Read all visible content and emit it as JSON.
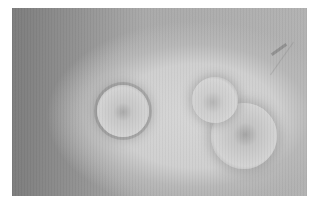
{
  "image": {
    "description": "Grayscale micrograph showing a single round cell on the left and a budding/dividing double cell on the right, set within a lighter halo on a darker grainy background",
    "objects": [
      {
        "name": "single-cell",
        "shape": "circle"
      },
      {
        "name": "budding-cell-upper",
        "shape": "circle"
      },
      {
        "name": "budding-cell-lower",
        "shape": "circle"
      }
    ],
    "colors": {
      "background_dark": "#7c7c7c",
      "halo_light": "#d6d6d6",
      "cell_rim": "#7d7d7d"
    }
  }
}
